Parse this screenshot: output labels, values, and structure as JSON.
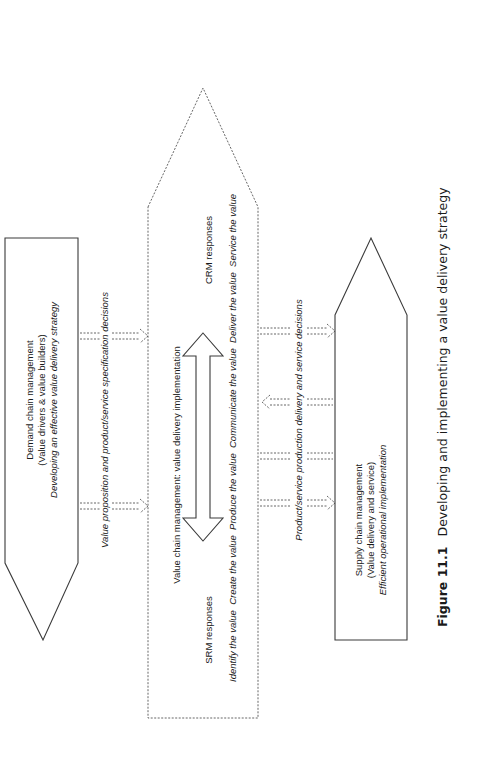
{
  "figure": {
    "caption_number": "Figure 11.1",
    "caption_text": "Developing and implementing a value delivery strategy"
  },
  "demand_chain": {
    "title": "Demand chain management",
    "subtitle": "(Value drivers & value builders)",
    "description": "Developing an effective value delivery strategy"
  },
  "value_chain": {
    "title": "Value chain management: value delivery implementation",
    "srm_label": "SRM responses",
    "crm_label": "CRM responses",
    "steps": "Identify the value  Create the value  Produce the value  Communicate the value  Deliver the value  Service the value"
  },
  "supply_chain": {
    "title": "Supply chain management",
    "subtitle": "(Value delivery and service)",
    "description": "Efficient operational implementation"
  },
  "connectors": {
    "left_label": "Value proposition and product/service specification decisions",
    "right_label": "Product/service production delivery and service decisions"
  }
}
